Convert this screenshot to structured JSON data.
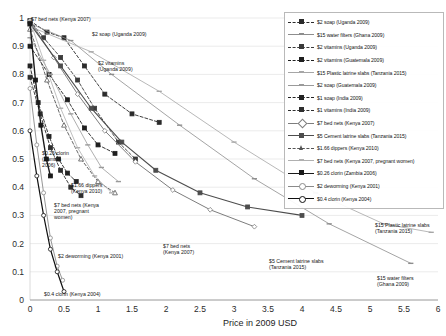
{
  "chart_data": {
    "type": "line",
    "title": "",
    "xlabel": "Price in 2009 USD",
    "ylabel": "",
    "xlim": [
      0,
      6
    ],
    "ylim": [
      0,
      1
    ],
    "xticks": [
      "0",
      "0.5",
      "1",
      "1.5",
      "2",
      "2.5",
      "3",
      "3.5",
      "4",
      "4.5",
      "5",
      "5.5",
      "6"
    ],
    "yticks": [
      "0",
      "0.1",
      "0.2",
      "0.3",
      "0.4",
      "0.5",
      "0.6",
      "0.7",
      "0.8",
      "0.9",
      "1"
    ],
    "grid": true,
    "legend_position": "top-right",
    "series": [
      {
        "name": "$2 soap (Uganda 2009)",
        "color": "#2b2b2b",
        "dash": "3,2",
        "marker": "square",
        "open": false,
        "width": 0.9,
        "points": [
          [
            0.0,
            0.99
          ],
          [
            0.25,
            0.95
          ],
          [
            0.5,
            0.93
          ],
          [
            0.8,
            0.83
          ],
          [
            1.1,
            0.73
          ],
          [
            1.5,
            0.66
          ],
          [
            1.9,
            0.63
          ]
        ]
      },
      {
        "name": "$15 water filters (Ghana 2009)",
        "color": "#8d8d8d",
        "dash": "0",
        "marker": "dash",
        "open": true,
        "width": 0.8,
        "points": [
          [
            0.0,
            0.98
          ],
          [
            0.6,
            0.92
          ],
          [
            1.2,
            0.8
          ],
          [
            2.2,
            0.62
          ],
          [
            3.3,
            0.43
          ],
          [
            4.4,
            0.27
          ],
          [
            5.6,
            0.13
          ]
        ]
      },
      {
        "name": "$2 vitamins (Uganda 2009)",
        "color": "#3a3a3a",
        "dash": "3,2",
        "marker": "square",
        "open": false,
        "width": 0.9,
        "points": [
          [
            0.0,
            0.99
          ],
          [
            0.2,
            0.93
          ],
          [
            0.45,
            0.86
          ],
          [
            0.7,
            0.78
          ],
          [
            0.95,
            0.68
          ],
          [
            1.3,
            0.56
          ],
          [
            1.55,
            0.5
          ]
        ]
      },
      {
        "name": "$2 vitamins (Guatemala 2009)",
        "color": "#1f1f1f",
        "dash": "3,2",
        "marker": "square",
        "open": false,
        "width": 0.9,
        "points": [
          [
            0.0,
            0.9
          ],
          [
            0.28,
            0.8
          ],
          [
            0.55,
            0.71
          ],
          [
            0.8,
            0.61
          ],
          [
            1.0,
            0.55
          ],
          [
            1.25,
            0.52
          ]
        ]
      },
      {
        "name": "$15 Plastic latrine slabs (Tanzania 2015)",
        "color": "#a6a6a6",
        "dash": "0",
        "marker": "dash",
        "open": true,
        "width": 0.8,
        "points": [
          [
            0.0,
            0.97
          ],
          [
            0.9,
            0.88
          ],
          [
            1.9,
            0.74
          ],
          [
            3.0,
            0.56
          ],
          [
            4.2,
            0.38
          ],
          [
            5.2,
            0.27
          ],
          [
            5.9,
            0.24
          ]
        ]
      },
      {
        "name": "$2 soap (Guatemala 2009)",
        "color": "#9a9a9a",
        "dash": "0",
        "marker": "dash",
        "open": true,
        "width": 0.8,
        "points": [
          [
            0.0,
            0.93
          ],
          [
            0.3,
            0.8
          ],
          [
            0.6,
            0.66
          ],
          [
            0.85,
            0.55
          ],
          [
            1.05,
            0.47
          ],
          [
            1.3,
            0.42
          ]
        ]
      },
      {
        "name": "$1 soap (India 2009)",
        "color": "#232323",
        "dash": "3,2",
        "marker": "square",
        "open": false,
        "width": 0.9,
        "points": [
          [
            0.0,
            0.83
          ],
          [
            0.12,
            0.7
          ],
          [
            0.28,
            0.58
          ],
          [
            0.42,
            0.5
          ],
          [
            0.55,
            0.45
          ],
          [
            0.68,
            0.42
          ]
        ]
      },
      {
        "name": "$1 vitamins (India 2009)",
        "color": "#2e2e2e",
        "dash": "3,2",
        "marker": "square",
        "open": false,
        "width": 0.9,
        "points": [
          [
            0.0,
            0.79
          ],
          [
            0.15,
            0.66
          ],
          [
            0.3,
            0.54
          ],
          [
            0.45,
            0.46
          ],
          [
            0.6,
            0.4
          ],
          [
            0.75,
            0.37
          ]
        ]
      },
      {
        "name": "$7 bed nets (Kenya 2007)",
        "color": "#7d7d7d",
        "dash": "0",
        "marker": "diamond",
        "open": true,
        "width": 1.0,
        "points": [
          [
            0.0,
            0.99
          ],
          [
            0.35,
            0.86
          ],
          [
            0.7,
            0.73
          ],
          [
            1.1,
            0.6
          ],
          [
            1.55,
            0.49
          ],
          [
            2.1,
            0.39
          ],
          [
            2.65,
            0.32
          ],
          [
            3.3,
            0.26
          ]
        ]
      },
      {
        "name": "$5 Cement latrine slabs (Tanzania 2015)",
        "color": "#4d4d4d",
        "dash": "0",
        "marker": "square",
        "open": false,
        "width": 1.1,
        "points": [
          [
            0.0,
            0.98
          ],
          [
            0.45,
            0.83
          ],
          [
            0.9,
            0.68
          ],
          [
            1.35,
            0.56
          ],
          [
            1.85,
            0.46
          ],
          [
            2.5,
            0.38
          ],
          [
            3.2,
            0.33
          ],
          [
            4.0,
            0.3
          ]
        ]
      },
      {
        "name": "$1.66 dippers (Kenya 2010)",
        "color": "#555555",
        "dash": "3,2",
        "marker": "triangle",
        "open": true,
        "width": 0.9,
        "points": [
          [
            0.0,
            0.96
          ],
          [
            0.25,
            0.78
          ],
          [
            0.5,
            0.62
          ],
          [
            0.75,
            0.5
          ],
          [
            1.0,
            0.42
          ],
          [
            1.25,
            0.38
          ]
        ]
      },
      {
        "name": "$7 bed nets (Kenya 2007, pregnant women)",
        "color": "#b0b0b0",
        "dash": "0",
        "marker": "dash",
        "open": true,
        "width": 0.8,
        "points": [
          [
            0.0,
            0.99
          ],
          [
            0.2,
            0.85
          ],
          [
            0.45,
            0.68
          ],
          [
            0.7,
            0.54
          ],
          [
            0.95,
            0.44
          ],
          [
            1.2,
            0.38
          ]
        ]
      },
      {
        "name": "$0.26 clorin (Zambia 2006)",
        "color": "#1a1a1a",
        "dash": "0",
        "marker": "square",
        "open": false,
        "width": 1.4,
        "points": [
          [
            0.0,
            0.98
          ],
          [
            0.08,
            0.78
          ],
          [
            0.16,
            0.62
          ],
          [
            0.24,
            0.5
          ],
          [
            0.3,
            0.44
          ]
        ]
      },
      {
        "name": "$2 deworming (Kenya 2001)",
        "color": "#8a8a8a",
        "dash": "0",
        "marker": "circle",
        "open": true,
        "width": 0.9,
        "points": [
          [
            0.0,
            0.75
          ],
          [
            0.1,
            0.55
          ],
          [
            0.2,
            0.38
          ],
          [
            0.3,
            0.22
          ],
          [
            0.4,
            0.12
          ],
          [
            0.48,
            0.07
          ]
        ]
      },
      {
        "name": "$0.4 clorin (Kenya 2004)",
        "color": "#101010",
        "dash": "0",
        "marker": "circle",
        "open": true,
        "width": 1.2,
        "points": [
          [
            0.0,
            0.6
          ],
          [
            0.1,
            0.44
          ],
          [
            0.2,
            0.3
          ],
          [
            0.3,
            0.18
          ],
          [
            0.4,
            0.1
          ],
          [
            0.5,
            0.03
          ]
        ]
      }
    ],
    "annotations": [
      {
        "text": "$7 bed nets (Kenya 2007)",
        "x": 31,
        "y": 16,
        "align": "left"
      },
      {
        "text": "$2 soap (Uganda 2009)",
        "x": 92,
        "y": 31,
        "align": "left"
      },
      {
        "text": "$2 vitamins\n(Uganda 2009)",
        "x": 98,
        "y": 60,
        "align": "left"
      },
      {
        "text": "$0.26 clorin\n(Zambia\n2006)",
        "x": 42,
        "y": 150,
        "align": "left"
      },
      {
        "text": "$1.66 dippers\n(Kenya 2010)",
        "x": 71,
        "y": 182,
        "align": "left"
      },
      {
        "text": "$7 bed nets (Kenya\n2007, pregnant\nwomen)",
        "x": 54,
        "y": 202,
        "align": "left"
      },
      {
        "text": "$2 deworming (Kenya 2001)",
        "x": 58,
        "y": 253,
        "align": "left"
      },
      {
        "text": "$0.4 clorin (Kenya 2004)",
        "x": 44,
        "y": 291,
        "align": "left"
      },
      {
        "text": "$7 bed nets\n(Kenya 2007)",
        "x": 163,
        "y": 243,
        "align": "left"
      },
      {
        "text": "$5 Cement latrine slabs\n(Tanzania 2015)",
        "x": 269,
        "y": 258,
        "align": "left"
      },
      {
        "text": "$15 Plastic latrine slabs\n(Tanzania 2015)",
        "x": 375,
        "y": 222,
        "align": "left"
      },
      {
        "text": "$15 water filters\n(Ghana 2009)",
        "x": 377,
        "y": 275,
        "align": "left"
      }
    ]
  },
  "legend": {
    "items": [
      {
        "label": "$2 soap (Uganda 2009)"
      },
      {
        "label": "$15 water filters (Ghana 2009)"
      },
      {
        "label": "$2 vitamins (Uganda 2009)"
      },
      {
        "label": "$2 vitamins (Guatemala 2009)"
      },
      {
        "label": "$15 Plastic latrine slabs (Tanzania 2015)"
      },
      {
        "label": "$2 soap (Guatemala 2009)"
      },
      {
        "label": "$1 soap (India 2009)"
      },
      {
        "label": "$1 vitamins (India 2009)"
      },
      {
        "label": "$7 bed nets (Kenya 2007)"
      },
      {
        "label": "$5 Cement latrine slabs (Tanzania 2015)"
      },
      {
        "label": "$1.66 dippers (Kenya 2010)"
      },
      {
        "label": "$7 bed nets (Kenya 2007, pregnant women)"
      },
      {
        "label": "$0.26 clorin (Zambia 2006)"
      },
      {
        "label": "$2 deworming (Kenya 2001)"
      },
      {
        "label": "$0.4 clorin (Kenya 2004)"
      }
    ]
  },
  "axis": {
    "x_title": "Price in 2009 USD"
  }
}
